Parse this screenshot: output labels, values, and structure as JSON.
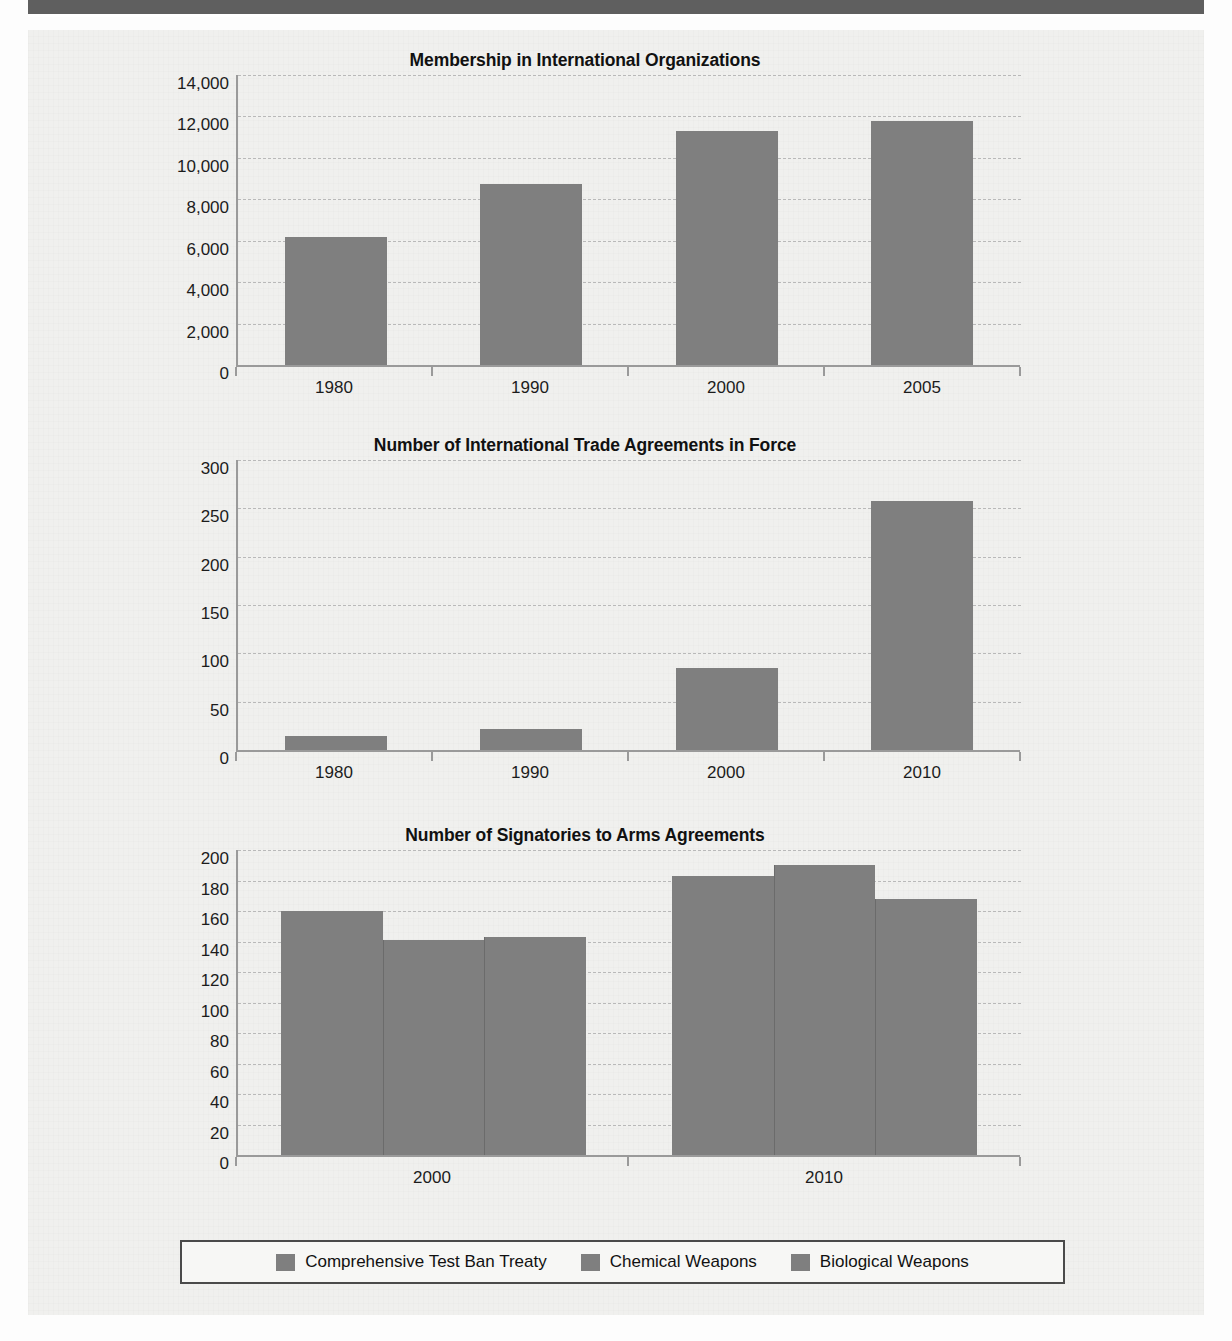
{
  "document": {
    "background_color": "#f0f0ee",
    "topbar_color": "#5f5f5f",
    "bar_color": "#7f7f7f"
  },
  "charts": [
    {
      "title": "Membership in International Organizations",
      "y_ticks": [
        "14,000",
        "12,000",
        "10,000",
        "8,000",
        "6,000",
        "4,000",
        "2,000",
        "0"
      ],
      "x_labels": [
        "1980",
        "1990",
        "2000",
        "2005"
      ]
    },
    {
      "title": "Number of International Trade Agreements in Force",
      "y_ticks": [
        "300",
        "250",
        "200",
        "150",
        "100",
        "50",
        "0"
      ],
      "x_labels": [
        "1980",
        "1990",
        "2000",
        "2010"
      ]
    },
    {
      "title": "Number of Signatories to Arms Agreements",
      "y_ticks": [
        "200",
        "180",
        "160",
        "140",
        "120",
        "100",
        "80",
        "60",
        "40",
        "20",
        "0"
      ],
      "x_labels": [
        "2000",
        "2010"
      ]
    }
  ],
  "legend": {
    "items": [
      {
        "label": "Comprehensive Test Ban Treaty",
        "color": "#7f7f7f"
      },
      {
        "label": "Chemical Weapons",
        "color": "#7f7f7f"
      },
      {
        "label": "Biological Weapons",
        "color": "#7f7f7f"
      }
    ]
  },
  "chart_data": [
    {
      "type": "bar",
      "title": "Membership in International Organizations",
      "xlabel": "",
      "ylabel": "",
      "categories": [
        "1980",
        "1990",
        "2000",
        "2005"
      ],
      "values": [
        6200,
        8750,
        11300,
        11800
      ],
      "ylim": [
        0,
        14000
      ],
      "ytick_values": [
        0,
        2000,
        4000,
        6000,
        8000,
        10000,
        12000,
        14000
      ],
      "ytick_labels": [
        "0",
        "2,000",
        "4,000",
        "6,000",
        "8,000",
        "10,000",
        "12,000",
        "14,000"
      ],
      "grid": true,
      "legend": false,
      "bar_color": "#7f7f7f"
    },
    {
      "type": "bar",
      "title": "Number of International Trade Agreements in Force",
      "xlabel": "",
      "ylabel": "",
      "categories": [
        "1980",
        "1990",
        "2000",
        "2010"
      ],
      "values": [
        15,
        22,
        85,
        258
      ],
      "ylim": [
        0,
        300
      ],
      "ytick_values": [
        0,
        50,
        100,
        150,
        200,
        250,
        300
      ],
      "ytick_labels": [
        "0",
        "50",
        "100",
        "150",
        "200",
        "250",
        "300"
      ],
      "grid": true,
      "legend": false,
      "bar_color": "#7f7f7f"
    },
    {
      "type": "bar",
      "title": "Number of Signatories to Arms Agreements",
      "xlabel": "",
      "ylabel": "",
      "categories": [
        "2000",
        "2010"
      ],
      "series": [
        {
          "name": "Comprehensive Test Ban Treaty",
          "values": [
            160,
            183
          ],
          "color": "#7f7f7f"
        },
        {
          "name": "Chemical Weapons",
          "values": [
            141,
            190
          ],
          "color": "#7f7f7f"
        },
        {
          "name": "Biological Weapons",
          "values": [
            143,
            168
          ],
          "color": "#7f7f7f"
        }
      ],
      "ylim": [
        0,
        200
      ],
      "ytick_values": [
        0,
        20,
        40,
        60,
        80,
        100,
        120,
        140,
        160,
        180,
        200
      ],
      "ytick_labels": [
        "0",
        "20",
        "40",
        "60",
        "80",
        "100",
        "120",
        "140",
        "160",
        "180",
        "200"
      ],
      "grid": true,
      "legend": true,
      "legend_position": "bottom"
    }
  ]
}
